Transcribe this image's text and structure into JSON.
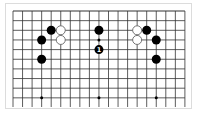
{
  "board": {
    "size": 19,
    "visible_rows": 10,
    "partial_bottom": true,
    "grid_color": "#333333",
    "star_points": [
      [
        4,
        4
      ],
      [
        10,
        4
      ],
      [
        16,
        4
      ],
      [
        4,
        10
      ],
      [
        10,
        10
      ],
      [
        16,
        10
      ]
    ]
  },
  "stones": [
    {
      "color": "black",
      "col": 5,
      "row": 3
    },
    {
      "color": "white",
      "col": 6,
      "row": 3
    },
    {
      "color": "black",
      "col": 4,
      "row": 4
    },
    {
      "color": "white",
      "col": 6,
      "row": 4
    },
    {
      "color": "black",
      "col": 4,
      "row": 6
    },
    {
      "color": "black",
      "col": 10,
      "row": 3
    },
    {
      "color": "black",
      "col": 10,
      "row": 5,
      "label": "1"
    },
    {
      "color": "white",
      "col": 14,
      "row": 3
    },
    {
      "color": "black",
      "col": 15,
      "row": 3
    },
    {
      "color": "white",
      "col": 14,
      "row": 4
    },
    {
      "color": "black",
      "col": 16,
      "row": 4
    },
    {
      "color": "black",
      "col": 16,
      "row": 6
    }
  ],
  "colors": {
    "black_stone": "#000000",
    "white_stone": "#ffffff",
    "white_stone_border": "#555555",
    "label_on_black": "#ffffff"
  }
}
